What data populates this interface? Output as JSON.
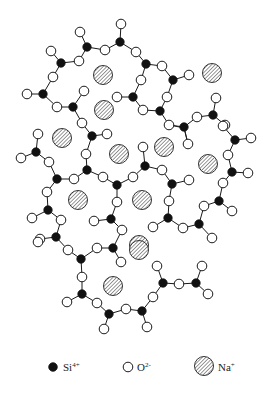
{
  "figure": {
    "colors": {
      "si": "#111111",
      "o": "#ffffff",
      "na_stroke": "#333333",
      "line": "#1a1a1a"
    }
  },
  "legend": [
    {
      "species": "si",
      "symbol": "Si",
      "charge": "4+",
      "icon": "filled-circle",
      "x": 53,
      "y": 367
    },
    {
      "species": "o",
      "symbol": "O",
      "charge": "2-",
      "icon": "open-circle",
      "x": 128,
      "y": 367
    },
    {
      "species": "na",
      "symbol": "Na",
      "charge": "+",
      "icon": "hatched-circle",
      "x": 204,
      "y": 366
    }
  ],
  "atoms": {
    "si": [
      [
        120,
        42
      ],
      [
        87,
        47
      ],
      [
        61,
        63
      ],
      [
        146,
        64
      ],
      [
        173,
        80
      ],
      [
        43,
        94
      ],
      [
        73,
        107
      ],
      [
        133,
        97
      ],
      [
        160,
        111
      ],
      [
        213,
        115
      ],
      [
        184,
        127
      ],
      [
        92,
        136
      ],
      [
        36,
        152
      ],
      [
        57,
        179
      ],
      [
        48,
        210
      ],
      [
        56,
        237
      ],
      [
        87,
        170
      ],
      [
        117,
        185
      ],
      [
        145,
        166
      ],
      [
        172,
        184
      ],
      [
        111,
        219
      ],
      [
        168,
        218
      ],
      [
        199,
        224
      ],
      [
        219,
        201
      ],
      [
        232,
        172
      ],
      [
        235,
        140
      ],
      [
        81,
        259
      ],
      [
        113,
        248
      ],
      [
        82,
        294
      ],
      [
        109,
        314
      ],
      [
        142,
        311
      ],
      [
        163,
        283
      ],
      [
        196,
        283
      ]
    ],
    "o": [
      [
        121,
        24
      ],
      [
        80,
        32
      ],
      [
        105,
        50
      ],
      [
        51,
        51
      ],
      [
        79,
        61
      ],
      [
        136,
        52
      ],
      [
        162,
        66
      ],
      [
        53,
        77
      ],
      [
        189,
        75
      ],
      [
        141,
        80
      ],
      [
        27,
        94
      ],
      [
        57,
        107
      ],
      [
        84,
        91
      ],
      [
        117,
        97
      ],
      [
        167,
        97
      ],
      [
        143,
        110
      ],
      [
        197,
        117
      ],
      [
        216,
        98
      ],
      [
        225,
        125
      ],
      [
        169,
        125
      ],
      [
        82,
        123
      ],
      [
        107,
        134
      ],
      [
        38,
        134
      ],
      [
        21,
        158
      ],
      [
        49,
        162
      ],
      [
        74,
        179
      ],
      [
        47,
        192
      ],
      [
        32,
        218
      ],
      [
        61,
        220
      ],
      [
        40,
        239
      ],
      [
        86,
        154
      ],
      [
        103,
        177
      ],
      [
        133,
        177
      ],
      [
        143,
        147
      ],
      [
        162,
        170
      ],
      [
        189,
        180
      ],
      [
        117,
        202
      ],
      [
        94,
        221
      ],
      [
        122,
        230
      ],
      [
        169,
        201
      ],
      [
        153,
        227
      ],
      [
        183,
        228
      ],
      [
        212,
        238
      ],
      [
        204,
        206
      ],
      [
        232,
        211
      ],
      [
        223,
        183
      ],
      [
        248,
        173
      ],
      [
        228,
        155
      ],
      [
        251,
        138
      ],
      [
        223,
        126
      ],
      [
        188,
        144
      ],
      [
        38,
        242
      ],
      [
        68,
        250
      ],
      [
        97,
        248
      ],
      [
        121,
        262
      ],
      [
        82,
        277
      ],
      [
        67,
        302
      ],
      [
        97,
        303
      ],
      [
        104,
        329
      ],
      [
        126,
        309
      ],
      [
        147,
        327
      ],
      [
        153,
        297
      ],
      [
        157,
        266
      ],
      [
        179,
        284
      ],
      [
        202,
        266
      ],
      [
        208,
        294
      ]
    ],
    "na": [
      [
        103,
        75
      ],
      [
        104,
        110
      ],
      [
        212,
        73
      ],
      [
        62,
        138
      ],
      [
        119,
        154
      ],
      [
        164,
        147
      ],
      [
        208,
        164
      ],
      [
        78,
        200
      ],
      [
        142,
        200
      ],
      [
        139,
        245
      ],
      [
        139,
        250
      ],
      [
        113,
        286
      ]
    ]
  },
  "bonds": [
    [
      [
        120,
        42
      ],
      [
        121,
        24
      ]
    ],
    [
      [
        120,
        42
      ],
      [
        105,
        50
      ]
    ],
    [
      [
        120,
        42
      ],
      [
        136,
        52
      ]
    ],
    [
      [
        87,
        47
      ],
      [
        80,
        32
      ]
    ],
    [
      [
        87,
        47
      ],
      [
        105,
        50
      ]
    ],
    [
      [
        87,
        47
      ],
      [
        79,
        61
      ]
    ],
    [
      [
        61,
        63
      ],
      [
        51,
        51
      ]
    ],
    [
      [
        61,
        63
      ],
      [
        79,
        61
      ]
    ],
    [
      [
        61,
        63
      ],
      [
        53,
        77
      ]
    ],
    [
      [
        146,
        64
      ],
      [
        136,
        52
      ]
    ],
    [
      [
        146,
        64
      ],
      [
        162,
        66
      ]
    ],
    [
      [
        146,
        64
      ],
      [
        141,
        80
      ]
    ],
    [
      [
        173,
        80
      ],
      [
        162,
        66
      ]
    ],
    [
      [
        173,
        80
      ],
      [
        189,
        75
      ]
    ],
    [
      [
        173,
        80
      ],
      [
        167,
        97
      ]
    ],
    [
      [
        43,
        94
      ],
      [
        53,
        77
      ]
    ],
    [
      [
        43,
        94
      ],
      [
        27,
        94
      ]
    ],
    [
      [
        43,
        94
      ],
      [
        57,
        107
      ]
    ],
    [
      [
        73,
        107
      ],
      [
        57,
        107
      ]
    ],
    [
      [
        73,
        107
      ],
      [
        84,
        91
      ]
    ],
    [
      [
        73,
        107
      ],
      [
        82,
        123
      ]
    ],
    [
      [
        133,
        97
      ],
      [
        117,
        97
      ]
    ],
    [
      [
        133,
        97
      ],
      [
        141,
        80
      ]
    ],
    [
      [
        133,
        97
      ],
      [
        143,
        110
      ]
    ],
    [
      [
        160,
        111
      ],
      [
        143,
        110
      ]
    ],
    [
      [
        160,
        111
      ],
      [
        167,
        97
      ]
    ],
    [
      [
        160,
        111
      ],
      [
        169,
        125
      ]
    ],
    [
      [
        213,
        115
      ],
      [
        216,
        98
      ]
    ],
    [
      [
        213,
        115
      ],
      [
        197,
        117
      ]
    ],
    [
      [
        213,
        115
      ],
      [
        225,
        125
      ]
    ],
    [
      [
        184,
        127
      ],
      [
        169,
        125
      ]
    ],
    [
      [
        184,
        127
      ],
      [
        197,
        117
      ]
    ],
    [
      [
        184,
        127
      ],
      [
        188,
        144
      ]
    ],
    [
      [
        92,
        136
      ],
      [
        82,
        123
      ]
    ],
    [
      [
        92,
        136
      ],
      [
        107,
        134
      ]
    ],
    [
      [
        92,
        136
      ],
      [
        86,
        154
      ]
    ],
    [
      [
        36,
        152
      ],
      [
        38,
        134
      ]
    ],
    [
      [
        36,
        152
      ],
      [
        21,
        158
      ]
    ],
    [
      [
        36,
        152
      ],
      [
        49,
        162
      ]
    ],
    [
      [
        57,
        179
      ],
      [
        49,
        162
      ]
    ],
    [
      [
        57,
        179
      ],
      [
        74,
        179
      ]
    ],
    [
      [
        57,
        179
      ],
      [
        47,
        192
      ]
    ],
    [
      [
        87,
        170
      ],
      [
        86,
        154
      ]
    ],
    [
      [
        87,
        170
      ],
      [
        74,
        179
      ]
    ],
    [
      [
        87,
        170
      ],
      [
        103,
        177
      ]
    ],
    [
      [
        117,
        185
      ],
      [
        103,
        177
      ]
    ],
    [
      [
        117,
        185
      ],
      [
        133,
        177
      ]
    ],
    [
      [
        117,
        185
      ],
      [
        117,
        202
      ]
    ],
    [
      [
        145,
        166
      ],
      [
        133,
        177
      ]
    ],
    [
      [
        145,
        166
      ],
      [
        143,
        147
      ]
    ],
    [
      [
        145,
        166
      ],
      [
        162,
        170
      ]
    ],
    [
      [
        172,
        184
      ],
      [
        162,
        170
      ]
    ],
    [
      [
        172,
        184
      ],
      [
        189,
        180
      ]
    ],
    [
      [
        172,
        184
      ],
      [
        169,
        201
      ]
    ],
    [
      [
        48,
        210
      ],
      [
        47,
        192
      ]
    ],
    [
      [
        48,
        210
      ],
      [
        32,
        218
      ]
    ],
    [
      [
        48,
        210
      ],
      [
        61,
        220
      ]
    ],
    [
      [
        56,
        237
      ],
      [
        61,
        220
      ]
    ],
    [
      [
        56,
        237
      ],
      [
        40,
        239
      ]
    ],
    [
      [
        56,
        237
      ],
      [
        68,
        250
      ]
    ],
    [
      [
        111,
        219
      ],
      [
        117,
        202
      ]
    ],
    [
      [
        111,
        219
      ],
      [
        94,
        221
      ]
    ],
    [
      [
        111,
        219
      ],
      [
        122,
        230
      ]
    ],
    [
      [
        168,
        218
      ],
      [
        169,
        201
      ]
    ],
    [
      [
        168,
        218
      ],
      [
        153,
        227
      ]
    ],
    [
      [
        168,
        218
      ],
      [
        183,
        228
      ]
    ],
    [
      [
        199,
        224
      ],
      [
        183,
        228
      ]
    ],
    [
      [
        199,
        224
      ],
      [
        204,
        206
      ]
    ],
    [
      [
        199,
        224
      ],
      [
        212,
        238
      ]
    ],
    [
      [
        219,
        201
      ],
      [
        204,
        206
      ]
    ],
    [
      [
        219,
        201
      ],
      [
        223,
        183
      ]
    ],
    [
      [
        219,
        201
      ],
      [
        232,
        211
      ]
    ],
    [
      [
        232,
        172
      ],
      [
        223,
        183
      ]
    ],
    [
      [
        232,
        172
      ],
      [
        248,
        173
      ]
    ],
    [
      [
        232,
        172
      ],
      [
        228,
        155
      ]
    ],
    [
      [
        235,
        140
      ],
      [
        228,
        155
      ]
    ],
    [
      [
        235,
        140
      ],
      [
        251,
        138
      ]
    ],
    [
      [
        235,
        140
      ],
      [
        223,
        126
      ]
    ],
    [
      [
        184,
        128
      ],
      [
        170,
        125
      ]
    ],
    [
      [
        184,
        128
      ],
      [
        188,
        144
      ]
    ],
    [
      [
        81,
        259
      ],
      [
        68,
        250
      ]
    ],
    [
      [
        81,
        259
      ],
      [
        97,
        248
      ]
    ],
    [
      [
        81,
        259
      ],
      [
        82,
        277
      ]
    ],
    [
      [
        113,
        248
      ],
      [
        97,
        248
      ]
    ],
    [
      [
        113,
        248
      ],
      [
        121,
        262
      ]
    ],
    [
      [
        113,
        248
      ],
      [
        122,
        230
      ]
    ],
    [
      [
        82,
        294
      ],
      [
        82,
        277
      ]
    ],
    [
      [
        82,
        294
      ],
      [
        67,
        302
      ]
    ],
    [
      [
        82,
        294
      ],
      [
        97,
        303
      ]
    ],
    [
      [
        109,
        314
      ],
      [
        97,
        303
      ]
    ],
    [
      [
        109,
        314
      ],
      [
        104,
        329
      ]
    ],
    [
      [
        109,
        314
      ],
      [
        126,
        309
      ]
    ],
    [
      [
        142,
        311
      ],
      [
        126,
        309
      ]
    ],
    [
      [
        142,
        311
      ],
      [
        147,
        327
      ]
    ],
    [
      [
        142,
        311
      ],
      [
        153,
        297
      ]
    ],
    [
      [
        163,
        283
      ],
      [
        153,
        297
      ]
    ],
    [
      [
        163,
        283
      ],
      [
        157,
        266
      ]
    ],
    [
      [
        163,
        283
      ],
      [
        179,
        284
      ]
    ],
    [
      [
        196,
        283
      ],
      [
        179,
        284
      ]
    ],
    [
      [
        196,
        283
      ],
      [
        202,
        266
      ]
    ],
    [
      [
        196,
        283
      ],
      [
        208,
        294
      ]
    ]
  ]
}
